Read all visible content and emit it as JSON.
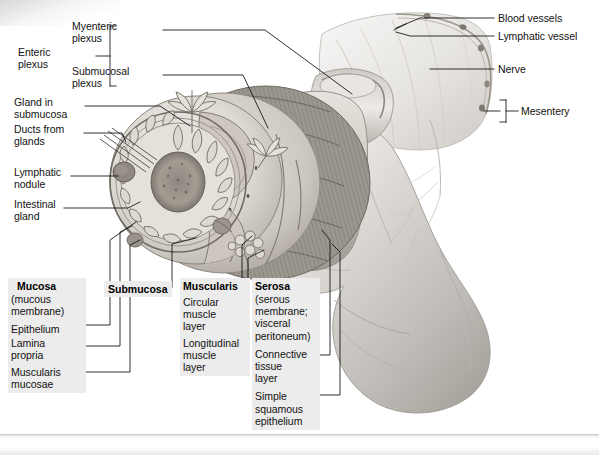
{
  "figure": {
    "type": "anatomical-illustration",
    "background_color": "#ffffff",
    "label_box_color": "#ececec",
    "ink_color": "#121212"
  },
  "left_labels": {
    "enteric_plexus": "Enteric\nplexus",
    "myenteric_plexus": "Myenteric\nplexus",
    "submucosal_plexus": "Submucosal\nplexus",
    "gland_in_submucosa": "Gland in\nsubmucosa",
    "ducts_from_glands": "Ducts from\nglands",
    "lymphatic_nodule": "Lymphatic\nnodule",
    "intestinal_gland": "Intestinal\ngland"
  },
  "right_labels": {
    "blood_vessels": "Blood vessels",
    "lymphatic_vessel": "Lymphatic vessel",
    "nerve": "Nerve",
    "mesentery": "Mesentery"
  },
  "layers": {
    "mucosa": {
      "title": "Mucosa",
      "subtitle": "(mucous\nmembrane)",
      "items": [
        "Epithelium",
        "Lamina\npropria",
        "Muscularis\nmucosae"
      ]
    },
    "submucosa": {
      "title": "Submucosa"
    },
    "muscularis": {
      "title": "Muscularis",
      "items": [
        "Circular\nmuscle\nlayer",
        "Longitudinal\nmuscle\nlayer"
      ]
    },
    "serosa": {
      "title": "Serosa",
      "subtitle": "(serous\nmembrane;\nvisceral\nperitoneum)",
      "items": [
        "Connective\ntissue\nlayer",
        "Simple\nsquamous\nepithelium"
      ]
    }
  }
}
